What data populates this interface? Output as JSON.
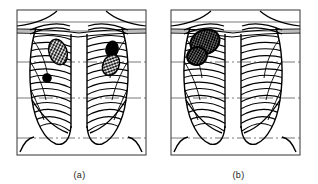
{
  "figure": {
    "type": "medical-line-illustration",
    "background_color": "#ffffff",
    "ink_color": "#000000",
    "reference_line_color": "#3a3a3a"
  },
  "panels": [
    {
      "id": "a",
      "caption": "(a)",
      "description": "Chest outline with both lungs showing multiple scattered rounded opacities",
      "frame": {
        "x": 17,
        "y": 10,
        "width": 129,
        "height": 145
      },
      "lesions": [
        {
          "name": "hatched-nodule-right-upper",
          "fill": "cross-hatch",
          "cx": 58,
          "cy": 52,
          "rx": 9,
          "ry": 13,
          "rotation": -18
        },
        {
          "name": "solid-nodule-right-mid",
          "fill": "solid",
          "cx": 47,
          "cy": 78,
          "rx": 4,
          "ry": 4,
          "rotation": 0
        },
        {
          "name": "solid-nodule-left-upper",
          "fill": "solid",
          "cx": 112,
          "cy": 49,
          "rx": 6,
          "ry": 8,
          "rotation": 15
        },
        {
          "name": "hatched-nodule-left-mid",
          "fill": "cross-hatch",
          "cx": 111,
          "cy": 65,
          "rx": 8,
          "ry": 11,
          "rotation": 25
        }
      ]
    },
    {
      "id": "b",
      "caption": "(b)",
      "description": "Chest outline with a single large lobulated mass in the right upper zone",
      "frame": {
        "x": 171,
        "y": 10,
        "width": 129,
        "height": 145
      },
      "lesions": [
        {
          "name": "large-lobulated-mass-upper-lobe",
          "fill": "dense-cross-hatch",
          "cx": 205,
          "cy": 42,
          "rx": 15,
          "ry": 12,
          "rotation": -25
        },
        {
          "name": "mass-lobe-lower",
          "fill": "dense-cross-hatch",
          "cx": 197,
          "cy": 56,
          "rx": 10,
          "ry": 9,
          "rotation": -15
        }
      ]
    }
  ],
  "captions": {
    "panel_a": "(a)",
    "panel_b": "(b)"
  }
}
